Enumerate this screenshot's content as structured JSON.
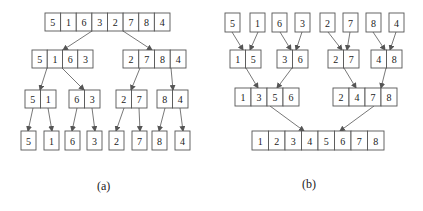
{
  "figure_a": {
    "caption": "(a)",
    "title": "Divide (split) phase of merge sort",
    "levels": [
      [
        {
          "values": [
            5,
            1,
            6,
            3,
            2,
            7,
            8,
            4
          ],
          "x": 45,
          "y": 13,
          "w": 125,
          "h": 18
        }
      ],
      [
        {
          "values": [
            5,
            1,
            6,
            3
          ],
          "x": 32,
          "y": 50,
          "w": 61,
          "h": 18
        },
        {
          "values": [
            2,
            7,
            8,
            4
          ],
          "x": 123,
          "y": 50,
          "w": 63,
          "h": 18
        }
      ],
      [
        {
          "values": [
            5,
            1
          ],
          "x": 25,
          "y": 90,
          "w": 31,
          "h": 18
        },
        {
          "values": [
            6,
            3
          ],
          "x": 69,
          "y": 90,
          "w": 31,
          "h": 18
        },
        {
          "values": [
            2,
            7
          ],
          "x": 116,
          "y": 90,
          "w": 31,
          "h": 18
        },
        {
          "values": [
            8,
            4
          ],
          "x": 157,
          "y": 90,
          "w": 31,
          "h": 18
        }
      ],
      [
        {
          "values": [
            5
          ],
          "x": 21,
          "y": 131,
          "w": 15,
          "h": 19
        },
        {
          "values": [
            1
          ],
          "x": 44,
          "y": 131,
          "w": 15,
          "h": 19
        },
        {
          "values": [
            6
          ],
          "x": 65,
          "y": 131,
          "w": 15,
          "h": 19
        },
        {
          "values": [
            3
          ],
          "x": 87,
          "y": 131,
          "w": 15,
          "h": 19
        },
        {
          "values": [
            2
          ],
          "x": 109,
          "y": 131,
          "w": 15,
          "h": 19
        },
        {
          "values": [
            7
          ],
          "x": 132,
          "y": 131,
          "w": 15,
          "h": 19
        },
        {
          "values": [
            8
          ],
          "x": 152,
          "y": 131,
          "w": 15,
          "h": 19
        },
        {
          "values": [
            4
          ],
          "x": 175,
          "y": 131,
          "w": 15,
          "h": 19
        }
      ]
    ],
    "edges": [
      [
        92,
        31,
        63,
        50
      ],
      [
        123,
        31,
        152,
        50
      ],
      [
        47,
        68,
        40,
        90
      ],
      [
        62,
        68,
        84,
        90
      ],
      [
        140,
        68,
        131,
        90
      ],
      [
        171,
        68,
        173,
        90
      ],
      [
        33,
        108,
        28,
        131
      ],
      [
        48,
        108,
        52,
        131
      ],
      [
        77,
        108,
        72,
        131
      ],
      [
        92,
        108,
        95,
        131
      ],
      [
        124,
        108,
        116,
        131
      ],
      [
        139,
        108,
        140,
        131
      ],
      [
        165,
        108,
        159,
        131
      ],
      [
        180,
        108,
        183,
        131
      ]
    ]
  },
  "figure_b": {
    "caption": "(b)",
    "title": "Merge phase of merge sort",
    "levels": [
      [
        {
          "values": [
            5
          ],
          "x": 225,
          "y": 13,
          "w": 15,
          "h": 19
        },
        {
          "values": [
            1
          ],
          "x": 250,
          "y": 13,
          "w": 15,
          "h": 19
        },
        {
          "values": [
            6
          ],
          "x": 272,
          "y": 13,
          "w": 15,
          "h": 19
        },
        {
          "values": [
            3
          ],
          "x": 295,
          "y": 13,
          "w": 15,
          "h": 19
        },
        {
          "values": [
            2
          ],
          "x": 320,
          "y": 13,
          "w": 15,
          "h": 19
        },
        {
          "values": [
            7
          ],
          "x": 343,
          "y": 13,
          "w": 15,
          "h": 19
        },
        {
          "values": [
            8
          ],
          "x": 366,
          "y": 13,
          "w": 15,
          "h": 19
        },
        {
          "values": [
            4
          ],
          "x": 389,
          "y": 13,
          "w": 15,
          "h": 19
        }
      ],
      [
        {
          "values": [
            1,
            5
          ],
          "x": 230,
          "y": 50,
          "w": 31,
          "h": 18
        },
        {
          "values": [
            3,
            6
          ],
          "x": 277,
          "y": 50,
          "w": 31,
          "h": 18
        },
        {
          "values": [
            2,
            7
          ],
          "x": 328,
          "y": 50,
          "w": 31,
          "h": 18
        },
        {
          "values": [
            4,
            8
          ],
          "x": 371,
          "y": 50,
          "w": 31,
          "h": 18
        }
      ],
      [
        {
          "values": [
            1,
            3,
            5,
            6
          ],
          "x": 235,
          "y": 88,
          "w": 64,
          "h": 18
        },
        {
          "values": [
            2,
            4,
            7,
            8
          ],
          "x": 333,
          "y": 88,
          "w": 64,
          "h": 18
        }
      ],
      [
        {
          "values": [
            1,
            2,
            3,
            4,
            5,
            6,
            7,
            8
          ],
          "x": 252,
          "y": 131,
          "w": 132,
          "h": 19
        }
      ]
    ],
    "edges": [
      [
        232,
        32,
        243,
        50
      ],
      [
        258,
        32,
        250,
        50
      ],
      [
        280,
        32,
        291,
        50
      ],
      [
        302,
        32,
        296,
        50
      ],
      [
        328,
        32,
        342,
        50
      ],
      [
        350,
        32,
        347,
        50
      ],
      [
        373,
        32,
        385,
        50
      ],
      [
        396,
        32,
        390,
        50
      ],
      [
        246,
        68,
        258,
        88
      ],
      [
        292,
        68,
        277,
        88
      ],
      [
        344,
        68,
        356,
        88
      ],
      [
        386,
        68,
        381,
        88
      ],
      [
        270,
        106,
        304,
        131
      ],
      [
        374,
        106,
        340,
        131
      ]
    ]
  },
  "captions": {
    "a": {
      "text": "(a)",
      "x": 97,
      "y": 179
    },
    "b": {
      "text": "(b)",
      "x": 302,
      "y": 177
    }
  }
}
